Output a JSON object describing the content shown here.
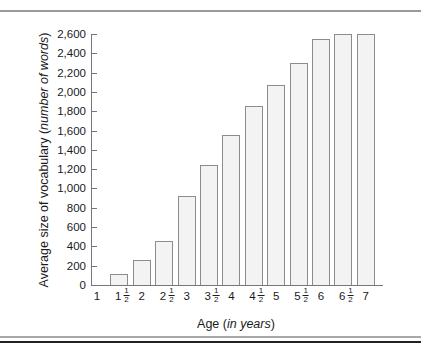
{
  "chart_data": {
    "type": "bar",
    "title": "",
    "xlabel": "Age",
    "xlabel_unit": "in years",
    "ylabel": "Average size of vocabulary",
    "ylabel_unit": "number of words",
    "categories": [
      "1",
      "1½",
      "2",
      "2½",
      "3",
      "3½",
      "4",
      "4½",
      "5",
      "5½",
      "6",
      "6½",
      "7"
    ],
    "values": [
      0,
      115,
      260,
      460,
      920,
      1240,
      1550,
      1850,
      2070,
      2300,
      2550,
      2600,
      2600
    ],
    "ylim": [
      0,
      2600
    ],
    "yticks": [
      0,
      200,
      400,
      600,
      800,
      1000,
      1200,
      1400,
      1600,
      1800,
      2000,
      2200,
      2400,
      2600
    ],
    "ytick_labels": [
      "0",
      "200",
      "400",
      "600",
      "800",
      "1,000",
      "1,200",
      "1,400",
      "1,600",
      "1,800",
      "2,000",
      "2,200",
      "2,400",
      "2,600"
    ],
    "grid": false,
    "legend": null,
    "bar_color": "#f3f3f3",
    "bar_edge_color": "#8c8c8c"
  },
  "xtick_labels": [
    {
      "whole": "1",
      "frac": false
    },
    {
      "whole": "1",
      "frac": true
    },
    {
      "whole": "2",
      "frac": false
    },
    {
      "whole": "2",
      "frac": true
    },
    {
      "whole": "3",
      "frac": false
    },
    {
      "whole": "3",
      "frac": true
    },
    {
      "whole": "4",
      "frac": false
    },
    {
      "whole": "4",
      "frac": true
    },
    {
      "whole": "5",
      "frac": false
    },
    {
      "whole": "5",
      "frac": true
    },
    {
      "whole": "6",
      "frac": false
    },
    {
      "whole": "6",
      "frac": true
    },
    {
      "whole": "7",
      "frac": false
    }
  ],
  "fraction": {
    "num": "1",
    "den": "2"
  },
  "labels": {
    "y_main": "Average size of vocabulary (",
    "y_italic": "number of words",
    "y_close": ")",
    "x_main": "Age (",
    "x_italic": "in years",
    "x_close": ")"
  }
}
